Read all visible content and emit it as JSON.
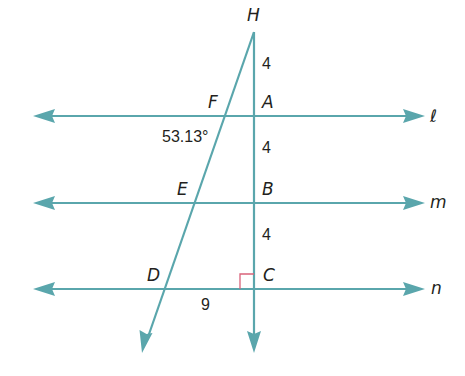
{
  "colors": {
    "line": "#5aa6ac",
    "right_angle": "#d9637a",
    "text": "#231f20"
  },
  "lines": {
    "l": {
      "label": "ℓ"
    },
    "m": {
      "label": "m"
    },
    "n": {
      "label": "n"
    }
  },
  "points": {
    "H": "H",
    "A": "A",
    "B": "B",
    "C": "C",
    "D": "D",
    "E": "E",
    "F": "F"
  },
  "measurements": {
    "HA": "4",
    "AB": "4",
    "BC": "4",
    "DC": "9",
    "angle_F": "53.13°"
  }
}
